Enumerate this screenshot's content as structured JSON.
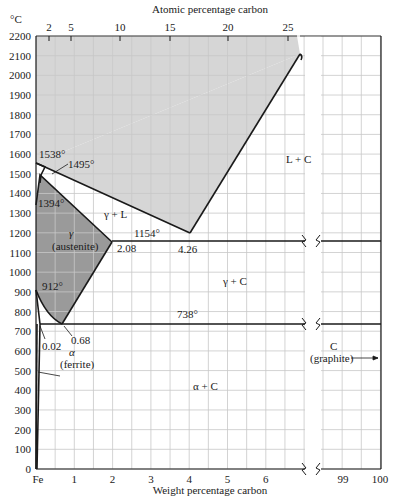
{
  "chart_data": {
    "type": "phase-diagram",
    "xlabel": "Weight percentage carbon",
    "x2label": "Atomic percentage carbon",
    "ylabel": "°C",
    "ylim": [
      0,
      2200
    ],
    "yticks": [
      0,
      100,
      200,
      300,
      400,
      500,
      600,
      700,
      800,
      900,
      1000,
      1100,
      1200,
      1300,
      1400,
      1500,
      1600,
      1700,
      1800,
      1900,
      2000,
      2100,
      2200
    ],
    "xticks": [
      "Fe",
      "1",
      "2",
      "3",
      "4",
      "5",
      "6",
      "99",
      "100"
    ],
    "x2ticks": [
      "2",
      "5",
      "10",
      "15",
      "20",
      "25"
    ],
    "grid": true,
    "axis_break": "between 6.9 and 98.5 wt% C",
    "regions": [
      {
        "label": "L",
        "shaded": "light"
      },
      {
        "label": "γ + L"
      },
      {
        "label": "L + C"
      },
      {
        "label": "γ",
        "sublabel": "(austenite)",
        "shaded": "dark"
      },
      {
        "label": "γ + C"
      },
      {
        "label": "α",
        "sublabel": "(ferrite)"
      },
      {
        "label": "α + C"
      },
      {
        "label": "C",
        "sublabel": "(graphite)"
      }
    ],
    "annotations": [
      {
        "text": "1538°",
        "wt": 0,
        "temp": 1538
      },
      {
        "text": "1495°",
        "wt": 0.5,
        "temp": 1495
      },
      {
        "text": "1394°",
        "wt": 0,
        "temp": 1394
      },
      {
        "text": "1154°",
        "wt": 3.0,
        "temp": 1154,
        "note": "eutectic line"
      },
      {
        "text": "2.08",
        "wt": 2.08,
        "temp": 1154
      },
      {
        "text": "4.26",
        "wt": 4.26,
        "temp": 1154
      },
      {
        "text": "912°",
        "wt": 0,
        "temp": 912
      },
      {
        "text": "738°",
        "wt": 4.0,
        "temp": 738,
        "note": "eutectoid line"
      },
      {
        "text": "0.68",
        "wt": 0.68,
        "temp": 738
      },
      {
        "text": "0.02",
        "wt": 0.02,
        "temp": 738
      }
    ],
    "lines": {
      "liquidus_left": [
        [
          0,
          1538
        ],
        [
          0.5,
          1495
        ],
        [
          4.26,
          1154
        ]
      ],
      "liquidus_right": [
        [
          4.26,
          1154
        ],
        [
          6.9,
          2100
        ]
      ],
      "solidus_gamma": [
        [
          0.17,
          1495
        ],
        [
          2.08,
          1154
        ]
      ],
      "solvus_gamma": [
        [
          2.08,
          1154
        ],
        [
          0.68,
          738
        ]
      ],
      "gamma_alpha_boundary": [
        [
          0,
          912
        ],
        [
          0.68,
          738
        ]
      ],
      "alpha_solvus": [
        [
          0.02,
          738
        ],
        [
          0,
          0
        ]
      ],
      "eutectic": [
        [
          2.08,
          1154
        ],
        [
          100,
          1154
        ]
      ],
      "eutectoid": [
        [
          0.02,
          738
        ],
        [
          100,
          738
        ]
      ]
    }
  },
  "labels": {
    "ylabel": "°C",
    "x2label": "Atomic percentage carbon",
    "xlabel": "Weight percentage carbon",
    "t1538": "1538°",
    "t1495": "1495°",
    "t1394": "1394°",
    "t1154": "1154°",
    "t912": "912°",
    "t738": "738°",
    "c208": "2.08",
    "c426": "4.26",
    "c068": "0.68",
    "c002": "0.02",
    "gammaL": "γ + L",
    "LC": "L + C",
    "gamma": "γ",
    "austenite": "(austenite)",
    "gammaC": "γ + C",
    "alpha": "α",
    "ferrite": "(ferrite)",
    "alphaC": "α + C",
    "C": "C",
    "graphite": "(graphite)"
  },
  "yticks": [
    "2200",
    "2100",
    "2000",
    "1900",
    "1800",
    "1700",
    "1600",
    "1500",
    "1400",
    "1300",
    "1200",
    "1100",
    "1000",
    "900",
    "800",
    "700",
    "600",
    "500",
    "400",
    "300",
    "200",
    "100",
    "0"
  ],
  "xticks": [
    "Fe",
    "1",
    "2",
    "3",
    "4",
    "5",
    "6"
  ],
  "xticks_right": [
    "99",
    "100"
  ],
  "x2ticks": [
    "2",
    "5",
    "10",
    "15",
    "20",
    "25"
  ],
  "colors": {
    "light_shade": "#d6d6d6",
    "dark_shade": "#9a9a9a",
    "grid": "#c8c8c8",
    "line": "#1a1a1a"
  }
}
